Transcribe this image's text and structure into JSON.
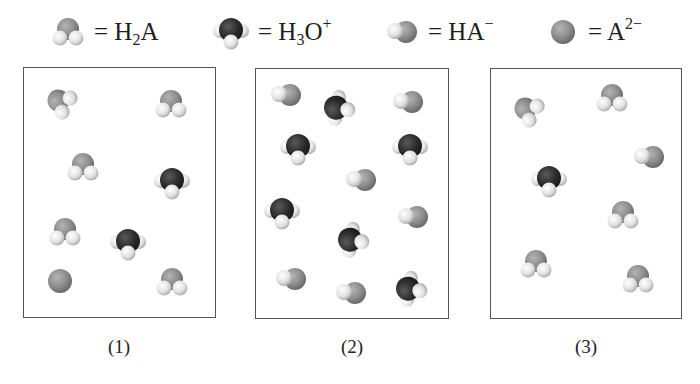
{
  "legend": [
    {
      "species": "H2A",
      "label_main": "= H",
      "label_sub": "2",
      "label_rest": "A",
      "label_sup": "",
      "icon": "h2a-molecule-icon"
    },
    {
      "species": "H3O+",
      "label_main": "= H",
      "label_sub": "3",
      "label_rest": "O",
      "label_sup": "+",
      "icon": "hydronium-molecule-icon"
    },
    {
      "species": "HA-",
      "label_main": "= HA",
      "label_sub": "",
      "label_rest": "",
      "label_sup": "−",
      "icon": "ha-minus-molecule-icon"
    },
    {
      "species": "A2-",
      "label_main": "= A",
      "label_sub": "",
      "label_rest": "",
      "label_sup": "2−",
      "icon": "a2-minus-molecule-icon"
    }
  ],
  "colors": {
    "h2a_center": "#8f8f8f",
    "hydronium_center": "#2e2e2e",
    "hydrogen": "#e6e6e6",
    "box_border": "#555555",
    "text": "#1e1e1e"
  },
  "panels": [
    {
      "label": "(1)",
      "counts": {
        "H2A": 5,
        "H3O+": 2,
        "HA-": 0,
        "A2-": 1
      },
      "molecules": [
        {
          "type": "H2A",
          "x": 61,
          "y": 102,
          "rot": -60
        },
        {
          "type": "H2A",
          "x": 171,
          "y": 104,
          "rot": 0
        },
        {
          "type": "H2A",
          "x": 83,
          "y": 167,
          "rot": 0
        },
        {
          "type": "H3O+",
          "x": 172,
          "y": 182,
          "rot": 0
        },
        {
          "type": "H2A",
          "x": 65,
          "y": 232,
          "rot": 0
        },
        {
          "type": "H3O+",
          "x": 128,
          "y": 243,
          "rot": 0
        },
        {
          "type": "A2-",
          "x": 60,
          "y": 281,
          "rot": 0
        },
        {
          "type": "H2A",
          "x": 172,
          "y": 282,
          "rot": 0
        }
      ]
    },
    {
      "label": "(2)",
      "counts": {
        "H2A": 0,
        "H3O+": 6,
        "HA-": 6,
        "A2-": 0
      },
      "molecules": [
        {
          "type": "HA-",
          "x": 286,
          "y": 95,
          "rot": 0
        },
        {
          "type": "H3O+",
          "x": 338,
          "y": 108,
          "rot": -80
        },
        {
          "type": "HA-",
          "x": 408,
          "y": 102,
          "rot": 0
        },
        {
          "type": "H3O+",
          "x": 298,
          "y": 148,
          "rot": 0
        },
        {
          "type": "H3O+",
          "x": 410,
          "y": 148,
          "rot": 0
        },
        {
          "type": "HA-",
          "x": 361,
          "y": 180,
          "rot": 0
        },
        {
          "type": "H3O+",
          "x": 282,
          "y": 212,
          "rot": 0
        },
        {
          "type": "HA-",
          "x": 413,
          "y": 217,
          "rot": 0
        },
        {
          "type": "H3O+",
          "x": 352,
          "y": 240,
          "rot": -80
        },
        {
          "type": "HA-",
          "x": 291,
          "y": 279,
          "rot": 0
        },
        {
          "type": "HA-",
          "x": 351,
          "y": 293,
          "rot": 0
        },
        {
          "type": "H3O+",
          "x": 410,
          "y": 289,
          "rot": -80
        }
      ]
    },
    {
      "label": "(3)",
      "counts": {
        "H2A": 5,
        "H3O+": 1,
        "HA-": 1,
        "A2-": 0
      },
      "molecules": [
        {
          "type": "H2A",
          "x": 528,
          "y": 110,
          "rot": -60
        },
        {
          "type": "H2A",
          "x": 612,
          "y": 98,
          "rot": 0
        },
        {
          "type": "HA-",
          "x": 649,
          "y": 157,
          "rot": 0
        },
        {
          "type": "H3O+",
          "x": 549,
          "y": 180,
          "rot": 0
        },
        {
          "type": "H2A",
          "x": 623,
          "y": 215,
          "rot": 0
        },
        {
          "type": "H2A",
          "x": 536,
          "y": 264,
          "rot": 0
        },
        {
          "type": "H2A",
          "x": 638,
          "y": 279,
          "rot": 0
        }
      ]
    }
  ]
}
